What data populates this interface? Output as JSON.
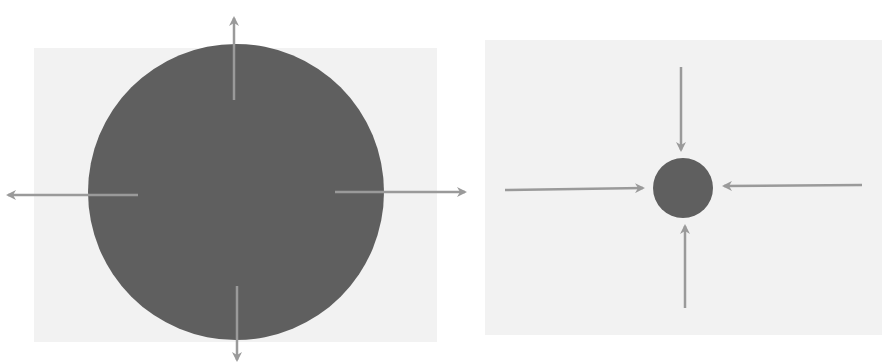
{
  "colors": {
    "background": "#ffffff",
    "panel": "#f2f2f2",
    "circle": "#5f5f5f",
    "arrow": "#9a9a9a"
  },
  "diagrams": [
    {
      "id": "expanding",
      "description": "large circle with four arrows pointing outward",
      "circle": {
        "cx": 236,
        "cy": 192,
        "r": 148
      },
      "arrows": [
        {
          "direction": "up",
          "x1": 234,
          "y1": 100,
          "x2": 234,
          "y2": 18
        },
        {
          "direction": "down",
          "x1": 237,
          "y1": 286,
          "x2": 237,
          "y2": 360
        },
        {
          "direction": "left",
          "x1": 138,
          "y1": 195,
          "x2": 8,
          "y2": 195
        },
        {
          "direction": "right",
          "x1": 335,
          "y1": 192,
          "x2": 465,
          "y2": 192
        }
      ]
    },
    {
      "id": "contracting",
      "description": "small circle with four arrows pointing inward",
      "circle": {
        "cx": 683,
        "cy": 188,
        "r": 30
      },
      "arrows": [
        {
          "direction": "down",
          "x1": 681,
          "y1": 67,
          "x2": 681,
          "y2": 150
        },
        {
          "direction": "up",
          "x1": 685,
          "y1": 308,
          "x2": 685,
          "y2": 226
        },
        {
          "direction": "right",
          "x1": 505,
          "y1": 190,
          "x2": 643,
          "y2": 188
        },
        {
          "direction": "left",
          "x1": 862,
          "y1": 185,
          "x2": 724,
          "y2": 186
        }
      ]
    }
  ]
}
